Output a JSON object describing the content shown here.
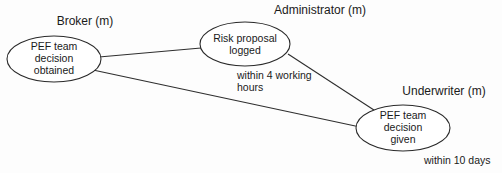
{
  "diagram": {
    "background_color": "#fdfdfd",
    "line_color": "#2e2e2e",
    "text_color": "#1a1a1a",
    "swimlanes": [
      {
        "id": "broker",
        "label": "Broker (m)"
      },
      {
        "id": "administrator",
        "label": "Administrator (m)"
      },
      {
        "id": "underwriter",
        "label": "Underwriter (m)"
      }
    ],
    "nodes": [
      {
        "id": "pef-team-decision-obtained",
        "lines": [
          "PEF team",
          "decision",
          "obtained"
        ],
        "line1": "PEF team",
        "line2": "decision",
        "line3": "obtained"
      },
      {
        "id": "risk-proposal-logged",
        "lines": [
          "Risk proposal",
          "logged"
        ],
        "line1": "Risk proposal",
        "line2": "logged"
      },
      {
        "id": "pef-team-decision-given",
        "lines": [
          "PEF team",
          "decision",
          "given"
        ],
        "line1": "PEF team",
        "line2": "decision",
        "line3": "given"
      }
    ],
    "annotations": [
      {
        "id": "within-4-working-hours",
        "line1": "within 4 working",
        "line2": "hours"
      },
      {
        "id": "within-10-days",
        "line1": "within 10 days"
      }
    ],
    "edges": [
      {
        "id": "edge-obtained-to-logged",
        "from": "pef-team-decision-obtained",
        "to": "risk-proposal-logged"
      },
      {
        "id": "edge-obtained-to-given",
        "from": "pef-team-decision-obtained",
        "to": "pef-team-decision-given"
      },
      {
        "id": "edge-logged-to-given",
        "from": "risk-proposal-logged",
        "to": "pef-team-decision-given"
      }
    ]
  }
}
